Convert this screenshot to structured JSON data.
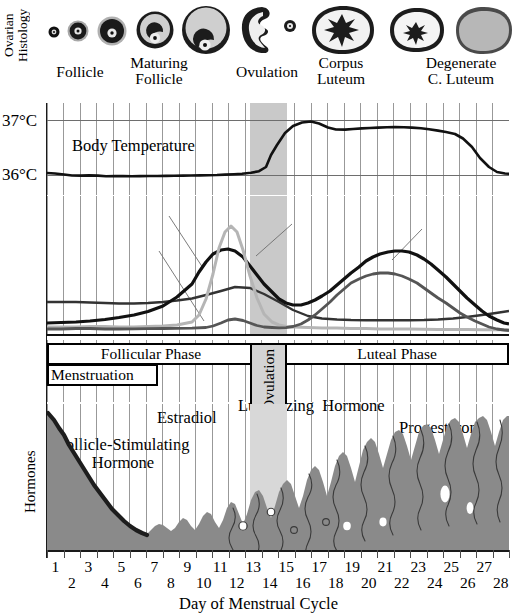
{
  "figure": {
    "width": 517,
    "height": 615
  },
  "ovarian": {
    "axis_label": "Ovarian\nHistology",
    "captions": [
      {
        "text": "Follicle",
        "x": 60,
        "y": 62
      },
      {
        "text": "Maturing\nFollicle",
        "x": 148,
        "y": 54
      },
      {
        "text": "Ovulation",
        "x": 228,
        "y": 62
      },
      {
        "text": "Corpus\nLuteum",
        "x": 338,
        "y": 54
      },
      {
        "text": "Degenerate\nC. Luteum",
        "x": 418,
        "y": 54
      }
    ],
    "stages": [
      {
        "name": "primordial-follicle",
        "cx": 54,
        "cy": 30,
        "r": 5,
        "type": "follicle"
      },
      {
        "name": "primary-follicle",
        "cx": 77,
        "cy": 29,
        "r": 10,
        "type": "follicle"
      },
      {
        "name": "secondary-follicle",
        "cx": 110,
        "cy": 29,
        "r": 14,
        "type": "follicle"
      },
      {
        "name": "maturing-follicle",
        "cx": 153,
        "cy": 28,
        "r": 19,
        "type": "antral"
      },
      {
        "name": "graafian-follicle",
        "cx": 205,
        "cy": 28,
        "r": 24,
        "type": "antral"
      },
      {
        "name": "ovulation-rupture",
        "cx": 263,
        "cy": 28,
        "r": 25,
        "type": "rupture"
      },
      {
        "name": "corpus-luteum",
        "cx": 340,
        "cy": 28,
        "r": 28,
        "type": "luteum"
      },
      {
        "name": "corpus-luteum-small",
        "cx": 412,
        "cy": 28,
        "r": 24,
        "type": "luteum-small"
      },
      {
        "name": "corpus-albicans",
        "cx": 478,
        "cy": 28,
        "r": 24,
        "type": "degenerate"
      }
    ]
  },
  "temperature": {
    "axis_ticks": [
      "37°C",
      "36°C"
    ],
    "curve_label": "Body Temperature",
    "unit": "°C",
    "ymin": 35.75,
    "ymax": 37.25
  },
  "hormones": {
    "axis_label": "Hormones",
    "labels": {
      "fsh": "Follicle-Stimulating\nHormone",
      "estradiol": "Estradiol",
      "lh": "Luteinizing  Hormone",
      "progesterone": "Progesterone"
    }
  },
  "phases": {
    "follicular": "Follicular Phase",
    "luteal": "Luteal Phase",
    "menstruation": "Menstruation",
    "ovulation": "Ovulation"
  },
  "endometrium": {
    "axis_label": "Endometrial\nHistology"
  },
  "axis": {
    "title": "Day of Menstrual Cycle",
    "days": [
      1,
      2,
      3,
      4,
      5,
      6,
      7,
      8,
      9,
      10,
      11,
      12,
      13,
      14,
      15,
      16,
      17,
      18,
      19,
      20,
      21,
      22,
      23,
      24,
      25,
      26,
      27,
      28
    ]
  },
  "colors": {
    "ink": "#000000",
    "grid": "#5a5a5a",
    "ovulation_band": "#c9c9c9",
    "endometrium_fill": "#8a8a8a",
    "menstrual_edge": "#1d1d1d",
    "curve_dark": "#111111",
    "curve_mid": "#555555",
    "curve_light": "#aaaaaa"
  },
  "chart_data": {
    "type": "line",
    "xlabel": "Day of Menstrual Cycle",
    "x": [
      1,
      2,
      3,
      4,
      5,
      6,
      7,
      8,
      9,
      10,
      11,
      12,
      13,
      14,
      15,
      16,
      17,
      18,
      19,
      20,
      21,
      22,
      23,
      24,
      25,
      26,
      27,
      28
    ],
    "xlim": [
      1,
      28
    ],
    "grid": true,
    "legend": "inline-annotations",
    "annotations": [
      {
        "text": "Ovulation",
        "day_range": [
          13.5,
          15.5
        ],
        "kind": "shaded-band"
      },
      {
        "text": "Follicular Phase",
        "day_range": [
          1,
          13.5
        ]
      },
      {
        "text": "Luteal Phase",
        "day_range": [
          15.5,
          28
        ]
      },
      {
        "text": "Menstruation",
        "day_range": [
          1,
          7.5
        ]
      }
    ],
    "panels": [
      {
        "name": "body-temperature",
        "ylabel": "°C",
        "ylim": [
          35.75,
          37.25
        ],
        "yticks": [
          36,
          37
        ],
        "series": [
          {
            "name": "Body Temperature",
            "color": "#111111",
            "values": [
              36.15,
              36.12,
              36.08,
              36.08,
              36.07,
              36.07,
              36.07,
              36.08,
              36.09,
              36.1,
              36.12,
              36.15,
              36.2,
              36.35,
              36.85,
              36.96,
              36.93,
              36.88,
              36.88,
              36.89,
              36.9,
              36.9,
              36.89,
              36.87,
              36.86,
              36.78,
              36.45,
              36.12
            ]
          }
        ]
      },
      {
        "name": "hormones",
        "ylabel": "Hormones",
        "ylim": [
          0,
          100
        ],
        "yticks": [],
        "series": [
          {
            "name": "Follicle-Stimulating Hormone",
            "color": "#333333",
            "values": [
              22,
              22,
              22,
              22,
              21,
              21,
              20,
              20,
              20,
              21,
              22,
              24,
              30,
              34,
              24,
              16,
              13,
              12,
              12,
              12,
              12,
              12,
              12,
              12,
              12,
              13,
              16,
              20
            ]
          },
          {
            "name": "Estradiol",
            "color": "#111111",
            "values": [
              10,
              10,
              11,
              12,
              14,
              16,
              19,
              23,
              29,
              38,
              52,
              68,
              76,
              70,
              52,
              44,
              44,
              48,
              56,
              64,
              70,
              72,
              70,
              64,
              54,
              40,
              26,
              14
            ]
          },
          {
            "name": "Luteinizing Hormone",
            "color": "#b5b5b5",
            "values": [
              8,
              8,
              8,
              9,
              9,
              8,
              8,
              9,
              9,
              10,
              12,
              20,
              55,
              86,
              40,
              14,
              9,
              8,
              8,
              8,
              8,
              8,
              8,
              8,
              8,
              8,
              8,
              8
            ]
          },
          {
            "name": "Progesterone",
            "color": "#555555",
            "values": [
              5,
              5,
              5,
              6,
              6,
              5,
              5,
              5,
              5,
              5,
              5,
              6,
              10,
              22,
              14,
              8,
              10,
              16,
              26,
              38,
              48,
              54,
              56,
              54,
              48,
              38,
              24,
              10
            ]
          }
        ]
      },
      {
        "name": "endometrial-thickness",
        "ylabel": "Endometrial Histology",
        "ylim": [
          0,
          100
        ],
        "values": [
          96,
          80,
          66,
          52,
          42,
          32,
          22,
          12,
          12,
          16,
          20,
          26,
          30,
          36,
          44,
          50,
          58,
          64,
          70,
          76,
          80,
          84,
          88,
          90,
          92,
          92,
          92,
          90
        ]
      }
    ]
  }
}
